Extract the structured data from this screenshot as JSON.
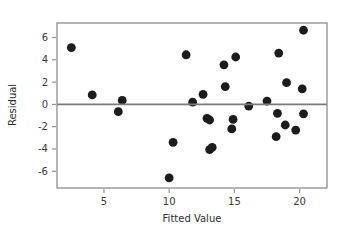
{
  "chart_data": {
    "type": "scatter",
    "title": "",
    "xlabel": "Fitted Value",
    "ylabel": "Residual",
    "xlim": [
      1.4,
      22.1
    ],
    "ylim": [
      -7.5,
      7.3
    ],
    "xticks": [
      5,
      10,
      15,
      20
    ],
    "yticks": [
      6,
      4,
      2,
      0,
      -2,
      -4,
      -6
    ],
    "xticklabels": [
      "5",
      "10",
      "15",
      "20"
    ],
    "yticklabels": [
      "6",
      "4",
      "2",
      "0",
      "-2",
      "-4",
      "-6"
    ],
    "grid": false,
    "legend": null,
    "reference_line": {
      "orientation": "horizontal",
      "y": 0,
      "color": "#7a7a7a"
    },
    "marker": {
      "shape": "circle",
      "color": "#1c1c1c",
      "size": 4.4
    },
    "frame_color": "#8c8c8c",
    "background": "#ffffff",
    "points": [
      {
        "x": 2.5,
        "y": 5.1
      },
      {
        "x": 4.1,
        "y": 0.85
      },
      {
        "x": 6.1,
        "y": -0.65
      },
      {
        "x": 6.4,
        "y": 0.35
      },
      {
        "x": 10.0,
        "y": -6.6
      },
      {
        "x": 10.3,
        "y": -3.4
      },
      {
        "x": 11.3,
        "y": 4.45
      },
      {
        "x": 11.8,
        "y": 0.2
      },
      {
        "x": 12.6,
        "y": 0.9
      },
      {
        "x": 12.9,
        "y": -1.25
      },
      {
        "x": 13.1,
        "y": -1.4
      },
      {
        "x": 13.1,
        "y": -4.05
      },
      {
        "x": 13.3,
        "y": -3.85
      },
      {
        "x": 14.2,
        "y": 3.55
      },
      {
        "x": 14.3,
        "y": 1.6
      },
      {
        "x": 14.8,
        "y": -2.2
      },
      {
        "x": 14.9,
        "y": -1.35
      },
      {
        "x": 15.1,
        "y": 4.25
      },
      {
        "x": 16.1,
        "y": -0.15
      },
      {
        "x": 17.5,
        "y": 0.3
      },
      {
        "x": 18.2,
        "y": -2.9
      },
      {
        "x": 18.3,
        "y": -0.8
      },
      {
        "x": 18.4,
        "y": 4.6
      },
      {
        "x": 18.9,
        "y": -1.85
      },
      {
        "x": 19.0,
        "y": 1.95
      },
      {
        "x": 19.7,
        "y": -2.3
      },
      {
        "x": 20.2,
        "y": 1.4
      },
      {
        "x": 20.3,
        "y": 6.65
      },
      {
        "x": 20.3,
        "y": -0.85
      }
    ]
  }
}
